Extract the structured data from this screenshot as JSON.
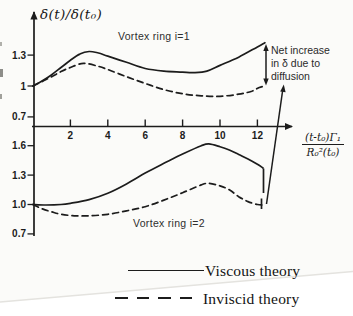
{
  "figure": {
    "y_axis_title": "δ(t)/δ(t₀)",
    "x_axis_fraction": {
      "numerator": "(t-t₀)Γ₁",
      "denominator": "R₀²(t₀)"
    },
    "annotation": "Net increase\nin δ due to\ndiffusion"
  },
  "legend": {
    "items": [
      {
        "label": "Viscous theory",
        "style": "solid"
      },
      {
        "label": "Inviscid theory",
        "style": "dashed"
      }
    ]
  },
  "colors": {
    "ink": "#1c1c1c",
    "paper": "#fbfbf9",
    "page_edge": "#e4e3df"
  },
  "chart_data": [
    {
      "type": "line",
      "title": "Vortex ring i=1",
      "ylabel": "δ(t)/δ(t₀)",
      "xlabel": "(t-t₀)Γ₁/R₀²(t₀)",
      "xlim": [
        0,
        13.8
      ],
      "ylim": [
        0.7,
        1.5
      ],
      "x_ticks": [
        {
          "v": 2,
          "label": "2"
        },
        {
          "v": 4,
          "label": "4"
        },
        {
          "v": 6,
          "label": "6"
        },
        {
          "v": 8,
          "label": "8"
        },
        {
          "v": 10,
          "label": "10"
        },
        {
          "v": 12,
          "label": "12"
        }
      ],
      "y_ticks": [
        {
          "v": 1.3,
          "label": "1.3"
        },
        {
          "v": 1.0,
          "label": "1"
        },
        {
          "v": 0.7,
          "label": "0.7"
        }
      ],
      "annotation": "Net increase in δ due to diffusion",
      "grid": false,
      "series": [
        {
          "name": "Viscous theory",
          "style": "solid",
          "points": [
            [
              0,
              1.0
            ],
            [
              0.5,
              1.05
            ],
            [
              1,
              1.11
            ],
            [
              1.5,
              1.18
            ],
            [
              2,
              1.25
            ],
            [
              2.5,
              1.31
            ],
            [
              3,
              1.335
            ],
            [
              3.5,
              1.32
            ],
            [
              4,
              1.29
            ],
            [
              5,
              1.23
            ],
            [
              6,
              1.17
            ],
            [
              7,
              1.145
            ],
            [
              8,
              1.135
            ],
            [
              8.6,
              1.13
            ],
            [
              9.3,
              1.145
            ],
            [
              10,
              1.2
            ],
            [
              11,
              1.28
            ],
            [
              12,
              1.38
            ],
            [
              12.4,
              1.42
            ]
          ]
        },
        {
          "name": "Inviscid theory",
          "style": "dashed",
          "points": [
            [
              0,
              1.0
            ],
            [
              0.5,
              1.045
            ],
            [
              1,
              1.09
            ],
            [
              1.5,
              1.14
            ],
            [
              2,
              1.18
            ],
            [
              2.7,
              1.22
            ],
            [
              3.5,
              1.19
            ],
            [
              4,
              1.16
            ],
            [
              5,
              1.09
            ],
            [
              6,
              1.025
            ],
            [
              7,
              0.965
            ],
            [
              8,
              0.925
            ],
            [
              9,
              0.905
            ],
            [
              10,
              0.9
            ],
            [
              11,
              0.92
            ],
            [
              11.7,
              0.95
            ],
            [
              12.1,
              0.985
            ],
            [
              12.4,
              1.0
            ]
          ]
        }
      ]
    },
    {
      "type": "line",
      "title": "Vortex ring i=2",
      "ylabel": "δ(t)/δ(t₀)",
      "xlabel": "(t-t₀)Γ₁/R₀²(t₀)",
      "xlim": [
        0,
        13.8
      ],
      "ylim": [
        0.7,
        1.75
      ],
      "x_ticks": [
        {
          "v": 2,
          "label": "2"
        },
        {
          "v": 4,
          "label": "4"
        },
        {
          "v": 6,
          "label": "6"
        },
        {
          "v": 8,
          "label": "8"
        },
        {
          "v": 10,
          "label": "10"
        },
        {
          "v": 12,
          "label": "12"
        }
      ],
      "y_ticks": [
        {
          "v": 1.6,
          "label": "1.6"
        },
        {
          "v": 1.3,
          "label": "1.3"
        },
        {
          "v": 1.0,
          "label": "1.0"
        },
        {
          "v": 0.7,
          "label": "0.7"
        }
      ],
      "grid": false,
      "series": [
        {
          "name": "Viscous theory",
          "style": "solid",
          "points": [
            [
              0,
              1.0
            ],
            [
              0.7,
              0.995
            ],
            [
              1.5,
              1.0
            ],
            [
              2,
              1.012
            ],
            [
              3,
              1.05
            ],
            [
              4,
              1.115
            ],
            [
              5,
              1.21
            ],
            [
              6,
              1.32
            ],
            [
              7,
              1.42
            ],
            [
              8,
              1.515
            ],
            [
              9,
              1.6
            ],
            [
              9.4,
              1.618
            ],
            [
              10,
              1.59
            ],
            [
              10.5,
              1.556
            ],
            [
              11,
              1.51
            ],
            [
              11.5,
              1.464
            ],
            [
              12,
              1.41
            ],
            [
              12.3,
              1.372
            ]
          ]
        },
        {
          "name": "Inviscid theory",
          "style": "dashed",
          "points": [
            [
              0,
              1.0
            ],
            [
              0.5,
              0.955
            ],
            [
              1,
              0.925
            ],
            [
              1.5,
              0.9
            ],
            [
              2.2,
              0.885
            ],
            [
              3,
              0.885
            ],
            [
              4,
              0.9
            ],
            [
              5,
              0.935
            ],
            [
              6,
              0.978
            ],
            [
              7,
              1.045
            ],
            [
              8,
              1.12
            ],
            [
              9,
              1.2
            ],
            [
              9.4,
              1.216
            ],
            [
              10,
              1.19
            ],
            [
              10.5,
              1.15
            ],
            [
              11,
              1.08
            ],
            [
              11.5,
              1.03
            ],
            [
              12,
              1.0
            ],
            [
              12.3,
              0.995
            ]
          ]
        }
      ]
    }
  ]
}
